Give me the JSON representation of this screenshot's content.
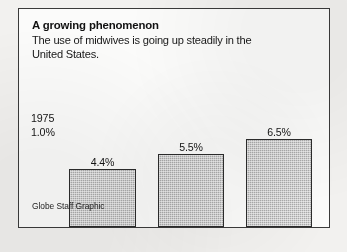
{
  "figure": {
    "title": "A growing phenomenon",
    "subtitle_lines": [
      "The use of midwives is going up steadily in the",
      "United States."
    ],
    "credit": "Globe Staff Graphic",
    "reference": {
      "year": "1975",
      "value_label": "1.0%"
    }
  },
  "chart_data": {
    "type": "bar",
    "title": "A growing phenomenon",
    "subtitle": "The use of midwives is going up steadily in the United States.",
    "categories": [
      "1994",
      "1995",
      "1996"
    ],
    "values": [
      4.4,
      5.5,
      6.5
    ],
    "value_labels": [
      "4.4%",
      "5.5%",
      "6.5%"
    ],
    "xlabel": "",
    "ylabel": "",
    "ylim": [
      0,
      7.5
    ],
    "grid": false,
    "legend": "none",
    "bar_color": "#ababab",
    "bar_border_color": "#2c2c2c",
    "annotations": [
      {
        "text": "1975",
        "value_label": "1.0%",
        "value": 1.0,
        "position": "left-of-first-bar"
      }
    ],
    "source": "Globe Staff Graphic"
  },
  "geometry": {
    "baseline_y": 160,
    "bars": [
      {
        "left": 50,
        "width": 67,
        "top": 102
      },
      {
        "left": 139,
        "width": 66,
        "top": 87
      },
      {
        "left": 227,
        "width": 66,
        "top": 72
      }
    ],
    "reference_left": 12,
    "reference_top": 103,
    "credit_top": 192
  }
}
